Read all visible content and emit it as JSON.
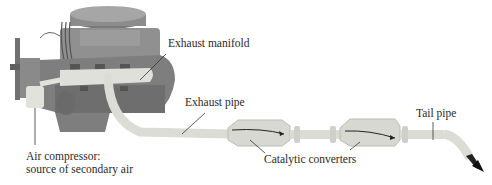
{
  "diagram": {
    "type": "engine exhaust system with secondary air injection",
    "labels": {
      "exhaust_manifold": "Exhaust manifold",
      "exhaust_pipe": "Exhaust pipe",
      "air_compressor_line1": "Air compressor:",
      "air_compressor_line2": "source of secondary air",
      "catalytic_converters": "Catalytic converters",
      "tail_pipe": "Tail pipe"
    },
    "colors": {
      "engine_body": "#8a8a8a",
      "engine_dark": "#5e5e5e",
      "pipe": "#dcdcd6",
      "pipe_edge": "#b8b8b0",
      "leader_line": "#333333",
      "text": "#2a2a2a"
    }
  }
}
